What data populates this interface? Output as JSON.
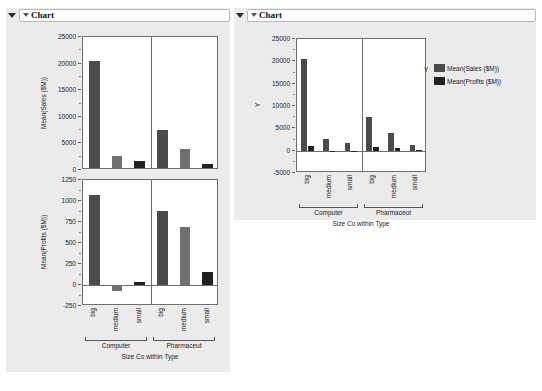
{
  "left_panel": {
    "header": {
      "title": "Chart",
      "disclosure_icon": "triangle-down-icon",
      "inner_icon": "triangle-down-small-icon"
    },
    "axis_title_x": "Size Co within Type",
    "groups": [
      "Computer",
      "Pharmaceut"
    ],
    "categories": [
      "big",
      "medium",
      "small",
      "big",
      "medium",
      "small"
    ]
  },
  "right_panel": {
    "header": {
      "title": "Chart",
      "disclosure_icon": "triangle-down-icon",
      "inner_icon": "triangle-down-small-icon"
    },
    "axis_title_x": "Size Co within Type",
    "axis_title_y": "Y",
    "groups": [
      "Computer",
      "Pharmaceut"
    ],
    "categories": [
      "big",
      "medium",
      "small",
      "big",
      "medium",
      "small"
    ],
    "legend": {
      "label": "Y",
      "items": [
        {
          "name": "Mean(Sales ($M))",
          "color": "#4b4b4b"
        },
        {
          "name": "Mean(Profits ($M))",
          "color": "#212121"
        }
      ]
    }
  },
  "colors": {
    "panel_background": "#ebebeb",
    "plot_background": "#ffffff",
    "axis": "#6e6e6e",
    "bar_dark": "#4b4b4b",
    "bar_darker": "#212121",
    "bar_medium": "#707070"
  },
  "chart_data": [
    {
      "id": "left-sales",
      "type": "bar",
      "title": "",
      "ylabel": "Mean(Sales ($M))",
      "xlabel": "Size Co within Type",
      "categories": [
        "big",
        "medium",
        "small",
        "big",
        "medium",
        "small"
      ],
      "groups": [
        "Computer",
        "Computer",
        "Computer",
        "Pharmaceut",
        "Pharmaceut",
        "Pharmaceut"
      ],
      "values": [
        20500,
        2700,
        1700,
        7500,
        4000,
        1200
      ],
      "yticks": [
        0,
        5000,
        10000,
        15000,
        20000,
        25000
      ],
      "yticklabels": [
        "0",
        "5000",
        "10000",
        "15000",
        "20000",
        "25000"
      ],
      "ylim": [
        0,
        25000
      ],
      "grid": false,
      "legend": "none"
    },
    {
      "id": "left-profits",
      "type": "bar",
      "title": "",
      "ylabel": "Mean(Profits ($M))",
      "xlabel": "Size Co within Type",
      "categories": [
        "big",
        "medium",
        "small",
        "big",
        "medium",
        "small"
      ],
      "groups": [
        "Computer",
        "Computer",
        "Computer",
        "Pharmaceut",
        "Pharmaceut",
        "Pharmaceut"
      ],
      "values": [
        1075,
        -75,
        30,
        880,
        690,
        150
      ],
      "yticks": [
        -250,
        0,
        250,
        500,
        750,
        1000,
        1250
      ],
      "yticklabels": [
        "-250",
        "0",
        "250",
        "500",
        "750",
        "1000",
        "1250"
      ],
      "ylim": [
        -250,
        1250
      ],
      "grid": false,
      "legend": "none"
    },
    {
      "id": "right-overlay",
      "type": "bar",
      "title": "",
      "ylabel": "Y",
      "xlabel": "Size Co within Type",
      "categories": [
        "big",
        "medium",
        "small",
        "big",
        "medium",
        "small"
      ],
      "groups": [
        "Computer",
        "Computer",
        "Computer",
        "Pharmaceut",
        "Pharmaceut",
        "Pharmaceut"
      ],
      "series": [
        {
          "name": "Mean(Sales ($M))",
          "color": "#4b4b4b",
          "values": [
            20500,
            2700,
            1700,
            7500,
            4000,
            1200
          ]
        },
        {
          "name": "Mean(Profits ($M))",
          "color": "#212121",
          "values": [
            1075,
            -75,
            30,
            880,
            690,
            150
          ]
        }
      ],
      "yticks": [
        -5000,
        0,
        5000,
        10000,
        15000,
        20000,
        25000
      ],
      "yticklabels": [
        "-5000",
        "0",
        "5000",
        "10000",
        "15000",
        "20000",
        "25000"
      ],
      "ylim": [
        -5000,
        25000
      ],
      "grid": false,
      "legend": "right"
    }
  ]
}
